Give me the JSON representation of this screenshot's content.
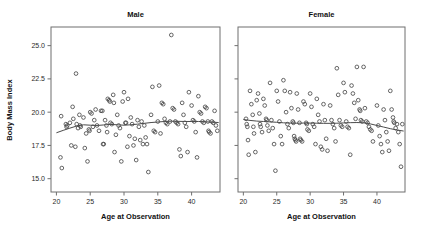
{
  "figure": {
    "width": 422,
    "height": 241,
    "background": "#ffffff",
    "point_color": "#4a4a4a",
    "line_color": "#4a4a4a",
    "frame_color": "#6f6f6f"
  },
  "axis_titles": {
    "y": "Body Mass Index",
    "x_left": "Age at Observation",
    "x_right": "Age at Observation"
  },
  "chart_data": [
    {
      "type": "scatter",
      "title": "Male",
      "xlabel": "Age at Observation",
      "ylabel": "Body Mass Index",
      "xlim": [
        19.2,
        44.2
      ],
      "ylim": [
        14.0,
        26.4
      ],
      "xticks": [
        20,
        25,
        30,
        35,
        40
      ],
      "yticks": [
        15.0,
        17.5,
        20.0,
        22.5,
        25.0
      ],
      "ytick_labels": [
        "15.0",
        "17.5",
        "20.0",
        "22.5",
        "25.0"
      ],
      "xtick_labels": [
        "20",
        "25",
        "30",
        "35",
        "40"
      ],
      "grid": false,
      "legend": "none",
      "marker": "open-circle",
      "points": [
        [
          20.6,
          16.6
        ],
        [
          20.7,
          19.7
        ],
        [
          20.8,
          15.8
        ],
        [
          21.4,
          19.1
        ],
        [
          21.5,
          18.9
        ],
        [
          21.6,
          19.0
        ],
        [
          22.0,
          19.2
        ],
        [
          22.2,
          17.5
        ],
        [
          22.4,
          20.4
        ],
        [
          22.5,
          19.5
        ],
        [
          22.8,
          17.4
        ],
        [
          22.9,
          22.9
        ],
        [
          23.0,
          19.1
        ],
        [
          23.2,
          18.8
        ],
        [
          23.4,
          19.8
        ],
        [
          23.5,
          19.0
        ],
        [
          23.6,
          18.9
        ],
        [
          24.0,
          19.6
        ],
        [
          24.2,
          17.3
        ],
        [
          24.4,
          18.4
        ],
        [
          24.6,
          16.3
        ],
        [
          24.8,
          18.7
        ],
        [
          24.9,
          18.6
        ],
        [
          25.0,
          20.0
        ],
        [
          25.2,
          19.9
        ],
        [
          25.4,
          18.9
        ],
        [
          25.6,
          19.4
        ],
        [
          25.8,
          20.2
        ],
        [
          26.0,
          19.0
        ],
        [
          26.3,
          18.6
        ],
        [
          26.6,
          20.1
        ],
        [
          26.8,
          20.1
        ],
        [
          26.9,
          17.6
        ],
        [
          27.0,
          17.6
        ],
        [
          27.2,
          19.4
        ],
        [
          27.4,
          19.0
        ],
        [
          27.5,
          18.5
        ],
        [
          27.6,
          21.0
        ],
        [
          27.8,
          20.9
        ],
        [
          27.9,
          20.8
        ],
        [
          28.0,
          19.2
        ],
        [
          28.2,
          19.1
        ],
        [
          28.4,
          21.3
        ],
        [
          28.5,
          20.7
        ],
        [
          28.6,
          17.0
        ],
        [
          28.8,
          18.3
        ],
        [
          29.0,
          19.8
        ],
        [
          29.2,
          19.0
        ],
        [
          29.4,
          18.8
        ],
        [
          29.6,
          16.3
        ],
        [
          29.8,
          20.8
        ],
        [
          30.0,
          21.5
        ],
        [
          30.2,
          19.2
        ],
        [
          30.3,
          19.2
        ],
        [
          30.5,
          17.4
        ],
        [
          30.6,
          21.0
        ],
        [
          30.8,
          18.2
        ],
        [
          31.0,
          19.6
        ],
        [
          31.2,
          19.1
        ],
        [
          31.4,
          17.5
        ],
        [
          31.6,
          18.0
        ],
        [
          31.8,
          16.4
        ],
        [
          32.0,
          19.4
        ],
        [
          32.2,
          18.9
        ],
        [
          32.4,
          17.9
        ],
        [
          32.6,
          19.3
        ],
        [
          32.8,
          17.6
        ],
        [
          33.0,
          19.0
        ],
        [
          33.2,
          18.1
        ],
        [
          33.4,
          17.6
        ],
        [
          33.6,
          15.5
        ],
        [
          34.0,
          19.8
        ],
        [
          34.2,
          21.9
        ],
        [
          34.4,
          18.6
        ],
        [
          34.6,
          18.5
        ],
        [
          35.0,
          19.3
        ],
        [
          35.2,
          22.0
        ],
        [
          35.4,
          18.4
        ],
        [
          35.6,
          20.7
        ],
        [
          35.8,
          20.6
        ],
        [
          36.0,
          19.5
        ],
        [
          36.2,
          19.2
        ],
        [
          36.4,
          19.1
        ],
        [
          36.8,
          19.3
        ],
        [
          37.0,
          25.8
        ],
        [
          37.2,
          20.3
        ],
        [
          37.4,
          20.2
        ],
        [
          37.6,
          19.3
        ],
        [
          37.8,
          19.2
        ],
        [
          38.0,
          19.1
        ],
        [
          38.2,
          17.2
        ],
        [
          38.4,
          16.7
        ],
        [
          38.6,
          20.7
        ],
        [
          38.8,
          19.8
        ],
        [
          39.0,
          19.2
        ],
        [
          39.2,
          18.9
        ],
        [
          39.4,
          17.0
        ],
        [
          39.6,
          21.5
        ],
        [
          40.0,
          20.5
        ],
        [
          40.2,
          19.4
        ],
        [
          40.4,
          19.3
        ],
        [
          40.6,
          18.5
        ],
        [
          40.8,
          16.6
        ],
        [
          41.0,
          21.2
        ],
        [
          41.2,
          20.0
        ],
        [
          41.4,
          19.9
        ],
        [
          41.6,
          19.3
        ],
        [
          41.8,
          19.2
        ],
        [
          42.0,
          20.4
        ],
        [
          42.2,
          20.3
        ],
        [
          42.4,
          19.3
        ],
        [
          42.5,
          18.6
        ],
        [
          42.6,
          18.5
        ],
        [
          42.8,
          18.4
        ],
        [
          43.0,
          19.3
        ],
        [
          43.2,
          19.2
        ],
        [
          43.4,
          20.1
        ],
        [
          43.6,
          19.0
        ],
        [
          43.8,
          18.6
        ]
      ],
      "trend": [
        [
          20.0,
          18.45
        ],
        [
          21.0,
          18.63
        ],
        [
          22.0,
          18.8
        ],
        [
          23.0,
          18.96
        ],
        [
          24.0,
          19.05
        ],
        [
          25.0,
          19.02
        ],
        [
          26.0,
          19.0
        ],
        [
          27.0,
          19.04
        ],
        [
          28.0,
          19.08
        ],
        [
          29.0,
          19.05
        ],
        [
          30.0,
          19.02
        ],
        [
          31.0,
          19.05
        ],
        [
          32.0,
          19.1
        ],
        [
          33.0,
          19.16
        ],
        [
          34.0,
          19.22
        ],
        [
          35.0,
          19.26
        ],
        [
          36.0,
          19.3
        ],
        [
          37.0,
          19.32
        ],
        [
          38.0,
          19.31
        ],
        [
          39.0,
          19.3
        ],
        [
          40.0,
          19.3
        ],
        [
          41.0,
          19.3
        ],
        [
          42.0,
          19.28
        ],
        [
          43.0,
          19.25
        ],
        [
          44.0,
          19.22
        ]
      ]
    },
    {
      "type": "scatter",
      "title": "Female",
      "xlabel": "Age at Observation",
      "ylabel": "Body Mass Index",
      "xlim": [
        19.2,
        44.2
      ],
      "ylim": [
        14.0,
        26.4
      ],
      "xticks": [
        20,
        25,
        30,
        35,
        40
      ],
      "yticks": [
        15.0,
        17.5,
        20.0,
        22.5,
        25.0
      ],
      "ytick_labels": [
        "15.0",
        "17.5",
        "20.0",
        "22.5",
        "25.0"
      ],
      "xtick_labels": [
        "20",
        "25",
        "30",
        "35",
        "40"
      ],
      "grid": false,
      "legend": "none",
      "marker": "open-circle",
      "points": [
        [
          20.4,
          19.5
        ],
        [
          20.5,
          19.1
        ],
        [
          20.6,
          18.9
        ],
        [
          20.7,
          17.9
        ],
        [
          20.8,
          16.8
        ],
        [
          21.0,
          21.6
        ],
        [
          21.2,
          20.6
        ],
        [
          21.4,
          19.8
        ],
        [
          21.5,
          18.9
        ],
        [
          21.6,
          18.4
        ],
        [
          21.8,
          17.0
        ],
        [
          22.0,
          20.9
        ],
        [
          22.2,
          21.4
        ],
        [
          22.4,
          19.9
        ],
        [
          22.5,
          19.1
        ],
        [
          22.6,
          18.9
        ],
        [
          22.8,
          18.5
        ],
        [
          23.0,
          21.0
        ],
        [
          23.2,
          20.5
        ],
        [
          23.4,
          19.5
        ],
        [
          23.5,
          19.4
        ],
        [
          23.6,
          19.0
        ],
        [
          23.8,
          18.6
        ],
        [
          24.0,
          22.2
        ],
        [
          24.2,
          19.4
        ],
        [
          24.4,
          18.8
        ],
        [
          24.6,
          17.6
        ],
        [
          24.8,
          15.6
        ],
        [
          25.0,
          21.6
        ],
        [
          25.2,
          20.8
        ],
        [
          25.4,
          19.3
        ],
        [
          25.6,
          18.2
        ],
        [
          25.8,
          17.6
        ],
        [
          26.0,
          22.4
        ],
        [
          26.2,
          21.6
        ],
        [
          26.4,
          20.0
        ],
        [
          26.6,
          19.1
        ],
        [
          26.8,
          18.8
        ],
        [
          27.0,
          21.5
        ],
        [
          27.2,
          20.3
        ],
        [
          27.4,
          19.3
        ],
        [
          27.5,
          19.2
        ],
        [
          27.6,
          18.2
        ],
        [
          27.7,
          18.0
        ],
        [
          27.8,
          17.9
        ],
        [
          27.9,
          17.8
        ],
        [
          28.0,
          21.4
        ],
        [
          28.2,
          20.2
        ],
        [
          28.4,
          19.2
        ],
        [
          28.5,
          18.0
        ],
        [
          28.6,
          17.9
        ],
        [
          28.8,
          17.8
        ],
        [
          29.0,
          20.8
        ],
        [
          29.2,
          20.6
        ],
        [
          29.4,
          19.2
        ],
        [
          29.5,
          19.1
        ],
        [
          29.6,
          18.7
        ],
        [
          29.8,
          18.6
        ],
        [
          30.0,
          21.4
        ],
        [
          30.2,
          20.4
        ],
        [
          30.4,
          19.1
        ],
        [
          30.6,
          18.9
        ],
        [
          30.8,
          17.6
        ],
        [
          31.0,
          21.0
        ],
        [
          31.2,
          19.8
        ],
        [
          31.4,
          19.3
        ],
        [
          31.6,
          17.4
        ],
        [
          31.8,
          17.2
        ],
        [
          32.0,
          20.6
        ],
        [
          32.2,
          19.4
        ],
        [
          32.4,
          18.0
        ],
        [
          32.6,
          17.1
        ],
        [
          33.0,
          20.5
        ],
        [
          33.2,
          19.4
        ],
        [
          33.4,
          19.1
        ],
        [
          33.6,
          18.8
        ],
        [
          33.8,
          17.8
        ],
        [
          34.0,
          23.3
        ],
        [
          34.2,
          21.3
        ],
        [
          34.4,
          19.4
        ],
        [
          34.6,
          19.0
        ],
        [
          34.8,
          18.9
        ],
        [
          35.0,
          22.2
        ],
        [
          35.2,
          21.5
        ],
        [
          35.4,
          19.3
        ],
        [
          35.6,
          18.9
        ],
        [
          35.8,
          18.8
        ],
        [
          36.0,
          16.8
        ],
        [
          36.2,
          22.0
        ],
        [
          36.4,
          21.4
        ],
        [
          36.6,
          20.7
        ],
        [
          36.8,
          19.5
        ],
        [
          37.0,
          23.4
        ],
        [
          37.2,
          20.9
        ],
        [
          37.4,
          20.2
        ],
        [
          37.5,
          20.1
        ],
        [
          37.6,
          19.4
        ],
        [
          37.8,
          19.3
        ],
        [
          38.0,
          23.4
        ],
        [
          38.2,
          20.3
        ],
        [
          38.4,
          19.3
        ],
        [
          38.6,
          19.2
        ],
        [
          38.8,
          18.9
        ],
        [
          39.0,
          18.7
        ],
        [
          39.2,
          18.6
        ],
        [
          39.4,
          17.8
        ],
        [
          40.0,
          20.5
        ],
        [
          40.2,
          19.0
        ],
        [
          40.4,
          18.2
        ],
        [
          40.6,
          17.6
        ],
        [
          40.8,
          17.0
        ],
        [
          41.0,
          20.2
        ],
        [
          41.2,
          19.4
        ],
        [
          41.4,
          18.5
        ],
        [
          41.6,
          17.8
        ],
        [
          41.8,
          17.1
        ],
        [
          42.0,
          21.6
        ],
        [
          42.2,
          20.2
        ],
        [
          42.4,
          19.6
        ],
        [
          42.5,
          19.3
        ],
        [
          42.6,
          19.2
        ],
        [
          42.8,
          18.8
        ],
        [
          43.0,
          19.1
        ],
        [
          43.2,
          18.5
        ],
        [
          43.4,
          17.6
        ],
        [
          43.6,
          15.9
        ],
        [
          43.8,
          19.1
        ]
      ],
      "trend": [
        [
          20.0,
          19.45
        ],
        [
          21.0,
          19.38
        ],
        [
          22.0,
          19.33
        ],
        [
          23.0,
          19.3
        ],
        [
          24.0,
          19.27
        ],
        [
          25.0,
          19.24
        ],
        [
          26.0,
          19.2
        ],
        [
          27.0,
          19.18
        ],
        [
          28.0,
          19.17
        ],
        [
          29.0,
          19.18
        ],
        [
          30.0,
          19.18
        ],
        [
          31.0,
          19.17
        ],
        [
          32.0,
          19.16
        ],
        [
          33.0,
          19.16
        ],
        [
          34.0,
          19.17
        ],
        [
          35.0,
          19.19
        ],
        [
          36.0,
          19.21
        ],
        [
          37.0,
          19.22
        ],
        [
          38.0,
          19.2
        ],
        [
          39.0,
          19.12
        ],
        [
          40.0,
          19.0
        ],
        [
          41.0,
          18.88
        ],
        [
          42.0,
          18.76
        ],
        [
          43.0,
          18.66
        ],
        [
          44.0,
          18.58
        ]
      ]
    }
  ]
}
